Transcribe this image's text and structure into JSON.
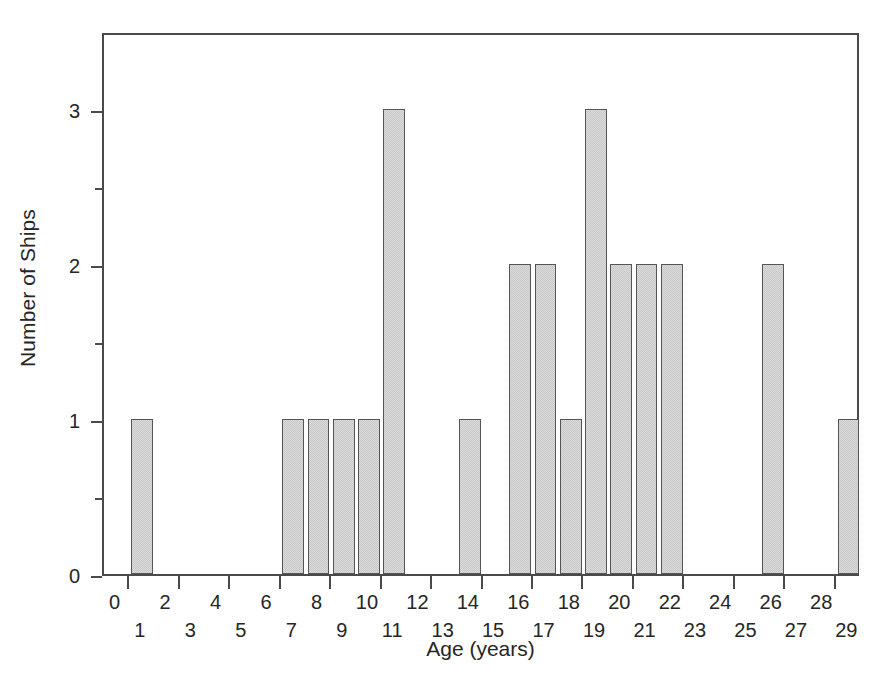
{
  "chart_data": {
    "type": "bar",
    "title": "",
    "subtitle": "",
    "xlabel": "Age (years)",
    "ylabel": "Number of Ships",
    "grid": false,
    "legend": null,
    "legend_position": "none",
    "xlim": [
      0,
      30
    ],
    "ylim": [
      0,
      3.5
    ],
    "yticks": [
      0,
      1,
      2,
      3
    ],
    "ytick_labels": [
      "0",
      "1",
      "2",
      "3"
    ],
    "yminor_ticks": [
      0.5,
      1.5,
      2.5
    ],
    "xtick_labels_top_row": [
      "0",
      "2",
      "4",
      "6",
      "8",
      "10",
      "12",
      "14",
      "16",
      "18",
      "20",
      "22",
      "24",
      "26",
      "28"
    ],
    "xtick_labels_bottom_row": [
      "1",
      "3",
      "5",
      "7",
      "9",
      "11",
      "13",
      "15",
      "17",
      "19",
      "21",
      "23",
      "25",
      "27",
      "29"
    ],
    "categories": [
      "0",
      "1",
      "2",
      "3",
      "4",
      "5",
      "6",
      "7",
      "8",
      "9",
      "10",
      "11",
      "12",
      "13",
      "14",
      "15",
      "16",
      "17",
      "18",
      "19",
      "20",
      "21",
      "22",
      "23",
      "24",
      "25",
      "26",
      "27",
      "28",
      "29"
    ],
    "values": [
      0,
      1,
      0,
      0,
      0,
      0,
      0,
      1,
      1,
      1,
      1,
      3,
      0,
      0,
      1,
      0,
      2,
      2,
      1,
      3,
      2,
      2,
      2,
      0,
      0,
      0,
      2,
      0,
      0,
      1
    ],
    "bar_fill_color": "#dadada",
    "bar_edge_color": "#555555",
    "axis_color": "#4a4a4a",
    "text_color": "#262626",
    "background_color": "#ffffff",
    "total_ships": 25
  }
}
